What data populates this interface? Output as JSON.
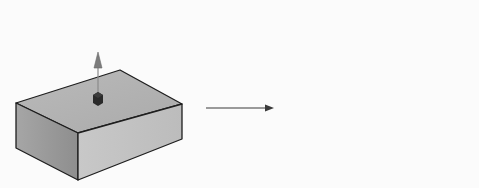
{
  "diagram": {
    "title": "Extrude boss: block with sketch point becomes block with cylinder",
    "before": {
      "label": "Block with sketch point and extrude direction arrow",
      "shape": "rectangular block",
      "feature": "sketch point marker with upward direction arrow"
    },
    "transition": {
      "label": "transforms into",
      "icon": "arrow-right-icon"
    },
    "after": {
      "label": "Block with extruded cylinder boss",
      "shape": "rectangular block",
      "feature": "cylinder protruding from top face"
    },
    "colors": {
      "background": "#fbfbfb",
      "top_face": "#b4b4b4",
      "left_face": "#9a9a9a",
      "front_face": "#c4c4c4",
      "edge": "#1e1e1e",
      "marker": "#2a2a2a",
      "direction_arrow": "#8a8a8a",
      "cylinder_light": "#eeeeee",
      "cylinder_dark": "#9c9c9c",
      "cylinder_top": "#b0b0b0"
    }
  }
}
